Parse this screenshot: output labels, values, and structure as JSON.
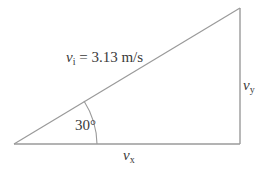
{
  "diagram": {
    "colors": {
      "line": "#9a9a9a",
      "text": "#3a3a3a",
      "background": "#ffffff"
    },
    "vertices": {
      "origin": [
        14,
        144
      ],
      "bottom_right": [
        240,
        144
      ],
      "top_right": [
        240,
        8
      ]
    },
    "hypotenuse": {
      "symbol": "v",
      "subscript": "i",
      "equals": " = 3.13 m/s",
      "value": 3.13,
      "unit": "m/s"
    },
    "vertical_side": {
      "symbol": "v",
      "subscript": "y"
    },
    "horizontal_side": {
      "symbol": "v",
      "subscript": "x"
    },
    "angle": {
      "label": "30°",
      "degrees": 30
    }
  }
}
